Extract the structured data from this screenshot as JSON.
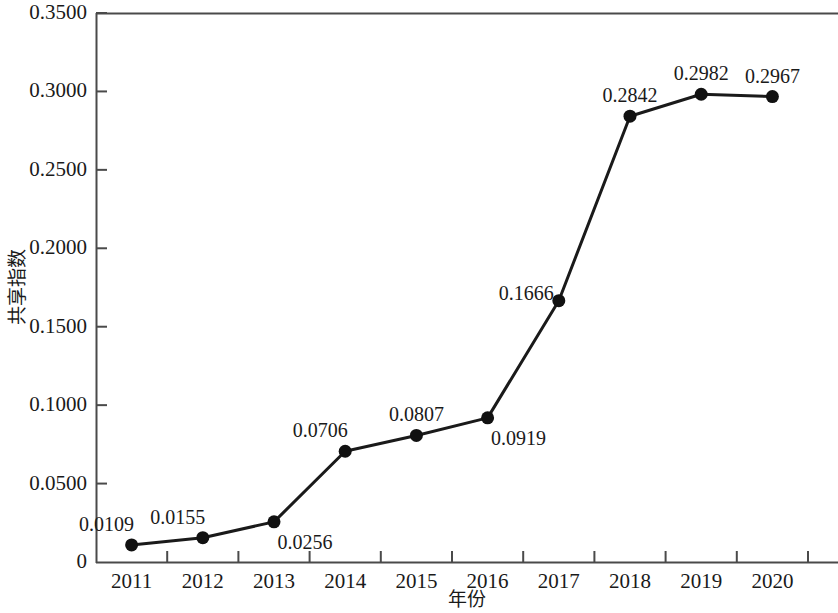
{
  "chart_data": {
    "type": "line",
    "title": "",
    "xlabel": "年份",
    "ylabel": "共享指数",
    "categories": [
      "2011",
      "2012",
      "2013",
      "2014",
      "2015",
      "2016",
      "2017",
      "2018",
      "2019",
      "2020"
    ],
    "values": [
      0.0109,
      0.0155,
      0.0256,
      0.0706,
      0.0807,
      0.0919,
      0.1666,
      0.2842,
      0.2982,
      0.2967
    ],
    "point_labels": [
      "0.0109",
      "0.0155",
      "0.0256",
      "0.0706",
      "0.0807",
      "0.0919",
      "0.1666",
      "0.2842",
      "0.2982",
      "0.2967"
    ],
    "label_positions": [
      "above-left",
      "above-left",
      "below-right",
      "above-left",
      "above",
      "below-right",
      "left",
      "above",
      "above",
      "above"
    ],
    "ylim": [
      0,
      0.35
    ],
    "ytick_values": [
      0,
      0.05,
      0.1,
      0.15,
      0.2,
      0.25,
      0.3,
      0.35
    ],
    "ytick_labels": [
      "0",
      "0.0500",
      "0.1000",
      "0.1500",
      "0.2000",
      "0.2500",
      "0.3000",
      "0.3500"
    ],
    "grid": false,
    "legend": "none",
    "line_color": "#1a1a1a",
    "marker_color": "#111111",
    "marker": "circle",
    "axis_color": "#4a4a4a"
  }
}
